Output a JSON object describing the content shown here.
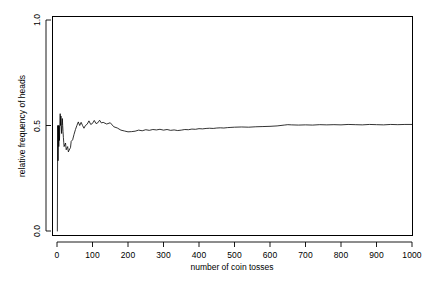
{
  "chart_data": {
    "type": "line",
    "title": "",
    "subtitle": "",
    "xlabel": "number of coin tosses",
    "ylabel": "relative frequency of heads",
    "xlim": [
      0,
      1040
    ],
    "ylim": [
      0.0,
      1.0
    ],
    "grid": false,
    "legend": null,
    "xticks": [
      0,
      100,
      200,
      300,
      400,
      500,
      600,
      700,
      800,
      900,
      1000
    ],
    "xtick_labels": [
      "0",
      "100",
      "200",
      "300",
      "400",
      "500",
      "600",
      "700",
      "800",
      "900",
      "1000"
    ],
    "yticks": [
      0.0,
      0.5,
      1.0
    ],
    "ytick_labels": [
      "0.0",
      "0.5",
      "1.0"
    ],
    "line_color": "#000000",
    "line_width": 0.8,
    "background_color": "#ffffff",
    "axis_color": "#000000",
    "series": [
      {
        "name": "running relative frequency of heads",
        "x": [
          1,
          2,
          3,
          4,
          5,
          6,
          7,
          8,
          9,
          10,
          11,
          12,
          13,
          14,
          15,
          16,
          17,
          18,
          19,
          20,
          22,
          24,
          26,
          28,
          30,
          32,
          34,
          36,
          38,
          40,
          44,
          48,
          52,
          56,
          60,
          64,
          68,
          72,
          76,
          80,
          85,
          90,
          95,
          100,
          105,
          110,
          115,
          120,
          125,
          130,
          140,
          150,
          160,
          170,
          180,
          190,
          200,
          210,
          220,
          230,
          240,
          250,
          260,
          270,
          280,
          290,
          300,
          310,
          320,
          330,
          340,
          350,
          360,
          370,
          380,
          390,
          400,
          410,
          420,
          430,
          440,
          450,
          460,
          470,
          480,
          490,
          500,
          520,
          540,
          560,
          580,
          600,
          620,
          640,
          650,
          660,
          680,
          700,
          720,
          740,
          760,
          780,
          800,
          820,
          840,
          860,
          880,
          900,
          920,
          940,
          960,
          980,
          1000
        ],
        "y": [
          0.0,
          0.5,
          0.333,
          0.5,
          0.4,
          0.5,
          0.429,
          0.5,
          0.556,
          0.5,
          0.545,
          0.5,
          0.462,
          0.5,
          0.533,
          0.5,
          0.471,
          0.444,
          0.421,
          0.4,
          0.409,
          0.417,
          0.385,
          0.393,
          0.4,
          0.375,
          0.382,
          0.389,
          0.395,
          0.425,
          0.432,
          0.458,
          0.481,
          0.5,
          0.517,
          0.5,
          0.515,
          0.5,
          0.487,
          0.5,
          0.506,
          0.522,
          0.505,
          0.51,
          0.524,
          0.509,
          0.513,
          0.525,
          0.512,
          0.515,
          0.507,
          0.513,
          0.494,
          0.488,
          0.478,
          0.474,
          0.47,
          0.471,
          0.473,
          0.478,
          0.475,
          0.48,
          0.477,
          0.481,
          0.479,
          0.482,
          0.478,
          0.481,
          0.477,
          0.479,
          0.476,
          0.478,
          0.481,
          0.48,
          0.483,
          0.482,
          0.485,
          0.484,
          0.486,
          0.487,
          0.486,
          0.488,
          0.489,
          0.488,
          0.49,
          0.491,
          0.492,
          0.493,
          0.492,
          0.494,
          0.495,
          0.496,
          0.498,
          0.502,
          0.504,
          0.503,
          0.502,
          0.503,
          0.502,
          0.504,
          0.503,
          0.504,
          0.503,
          0.505,
          0.504,
          0.503,
          0.505,
          0.504,
          0.503,
          0.505,
          0.504,
          0.505,
          0.505
        ],
        "annotations": []
      }
    ]
  }
}
